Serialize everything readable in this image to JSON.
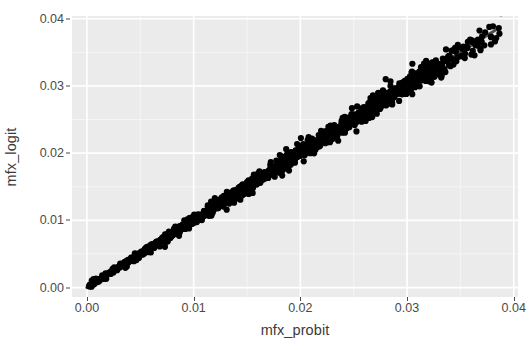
{
  "chart_data": {
    "type": "scatter",
    "title": "",
    "subtitle": "",
    "xlabel": "mfx_probit",
    "ylabel": "mfx_logit",
    "xlim": [
      -0.0014,
      0.0404
    ],
    "ylim": [
      -0.0014,
      0.0404
    ],
    "xticks": [
      "0.00",
      "0.01",
      "0.02",
      "0.03",
      "0.04"
    ],
    "xtick_values": [
      0.0,
      0.01,
      0.02,
      0.03,
      0.04
    ],
    "yticks": [
      "0.00",
      "0.01",
      "0.02",
      "0.03",
      "0.04"
    ],
    "ytick_values": [
      0.0,
      0.01,
      0.02,
      0.03,
      0.04
    ],
    "grid": true,
    "grid_major_color": "#ffffff",
    "grid_minor_color": "#f5f5f5",
    "panel_background": "#ebebeb",
    "figure_background": "#ffffff",
    "legend": "none",
    "point_color": "#000000",
    "point_size": 3.1,
    "fit_line_color": "#4d4d4d",
    "fit_line": {
      "x_start": 0.0,
      "y_start": 0.0,
      "x_end": 0.0386,
      "y_end": 0.0386,
      "slope": 1.0,
      "intercept": 0.0
    },
    "series": [
      {
        "name": "mfx_logit vs mfx_probit",
        "n_points": 900,
        "x": [
          0.0002,
          0.0009,
          0.0016,
          0.0023,
          0.0028,
          0.0034,
          0.0039,
          0.0043,
          0.0047,
          0.0051,
          0.0055,
          0.0059,
          0.0062,
          0.0066,
          0.0069,
          0.0072,
          0.0075,
          0.0078,
          0.0081,
          0.0084,
          0.0087,
          0.009,
          0.0092,
          0.0095,
          0.0098,
          0.01,
          0.0103,
          0.0105,
          0.0108,
          0.011,
          0.0113,
          0.0115,
          0.0117,
          0.012,
          0.0122,
          0.0124,
          0.0127,
          0.0129,
          0.0131,
          0.0133,
          0.0135,
          0.0138,
          0.014,
          0.0142,
          0.0144,
          0.0146,
          0.0148,
          0.015,
          0.0152,
          0.0154,
          0.0156,
          0.0158,
          0.016,
          0.0162,
          0.0164,
          0.0166,
          0.0168,
          0.017,
          0.0172,
          0.0174,
          0.0176,
          0.0178,
          0.018,
          0.0182,
          0.0184,
          0.0186,
          0.0188,
          0.019,
          0.0192,
          0.0194,
          0.0196,
          0.0198,
          0.02,
          0.0202,
          0.0204,
          0.0206,
          0.0208,
          0.021,
          0.0212,
          0.0214,
          0.0216,
          0.0218,
          0.022,
          0.0222,
          0.0224,
          0.0226,
          0.0228,
          0.023,
          0.0232,
          0.0234,
          0.0236,
          0.0238,
          0.024,
          0.0242,
          0.0244,
          0.0246,
          0.0248,
          0.025,
          0.0252,
          0.0254,
          0.0256,
          0.0258,
          0.026,
          0.0262,
          0.0264,
          0.0266,
          0.0268,
          0.027,
          0.0272,
          0.0274,
          0.0276,
          0.0278,
          0.0281,
          0.0283,
          0.0285,
          0.0287,
          0.0289,
          0.0291,
          0.0293,
          0.0295,
          0.0297,
          0.0299,
          0.0301,
          0.0303,
          0.0305,
          0.0307,
          0.0309,
          0.0311,
          0.0313,
          0.0315,
          0.0317,
          0.0319,
          0.0321,
          0.0323,
          0.0325,
          0.0328,
          0.033,
          0.0333,
          0.0336,
          0.0339,
          0.0342,
          0.0346,
          0.035,
          0.0355,
          0.036,
          0.0366,
          0.0372,
          0.0379,
          0.0386
        ],
        "y": [
          0.0002,
          0.0009,
          0.0016,
          0.0023,
          0.0028,
          0.0034,
          0.0039,
          0.0043,
          0.0047,
          0.0051,
          0.0055,
          0.0059,
          0.0062,
          0.0066,
          0.0069,
          0.0072,
          0.0075,
          0.0078,
          0.0081,
          0.0084,
          0.0087,
          0.009,
          0.0092,
          0.0095,
          0.0098,
          0.01,
          0.0103,
          0.0105,
          0.0108,
          0.011,
          0.0113,
          0.0115,
          0.0117,
          0.012,
          0.0122,
          0.0124,
          0.0127,
          0.0129,
          0.0131,
          0.0133,
          0.0135,
          0.0138,
          0.014,
          0.0142,
          0.0144,
          0.0146,
          0.0148,
          0.015,
          0.0152,
          0.0154,
          0.0156,
          0.0158,
          0.016,
          0.0162,
          0.0164,
          0.0166,
          0.0168,
          0.017,
          0.0172,
          0.0174,
          0.0176,
          0.0178,
          0.018,
          0.0182,
          0.0184,
          0.0186,
          0.0188,
          0.019,
          0.0192,
          0.0194,
          0.0196,
          0.0198,
          0.02,
          0.0202,
          0.0204,
          0.0206,
          0.0208,
          0.021,
          0.0212,
          0.0214,
          0.0216,
          0.0218,
          0.022,
          0.0222,
          0.0224,
          0.0226,
          0.0228,
          0.023,
          0.0232,
          0.0234,
          0.0236,
          0.0238,
          0.024,
          0.0242,
          0.0244,
          0.0246,
          0.0248,
          0.025,
          0.0252,
          0.0254,
          0.0256,
          0.0258,
          0.026,
          0.0262,
          0.0264,
          0.0266,
          0.0268,
          0.027,
          0.0272,
          0.0274,
          0.0276,
          0.0278,
          0.0281,
          0.0283,
          0.0285,
          0.0287,
          0.0289,
          0.0291,
          0.0293,
          0.0295,
          0.0297,
          0.0299,
          0.0301,
          0.0303,
          0.0305,
          0.0307,
          0.0309,
          0.0311,
          0.0313,
          0.0315,
          0.0317,
          0.0319,
          0.0321,
          0.0323,
          0.0325,
          0.0328,
          0.033,
          0.0333,
          0.0336,
          0.0339,
          0.0342,
          0.0346,
          0.035,
          0.0355,
          0.036,
          0.0366,
          0.0372,
          0.0379,
          0.0386
        ]
      }
    ],
    "outliers": [
      {
        "x": 0.028,
        "y": 0.031
      },
      {
        "x": 0.0305,
        "y": 0.0333
      },
      {
        "x": 0.0316,
        "y": 0.0325
      },
      {
        "x": 0.0323,
        "y": 0.0305
      },
      {
        "x": 0.0345,
        "y": 0.0352
      },
      {
        "x": 0.0352,
        "y": 0.0345
      },
      {
        "x": 0.0368,
        "y": 0.0365
      },
      {
        "x": 0.0327,
        "y": 0.0338
      },
      {
        "x": 0.0299,
        "y": 0.0288
      },
      {
        "x": 0.0262,
        "y": 0.0252
      }
    ],
    "annotations": []
  }
}
